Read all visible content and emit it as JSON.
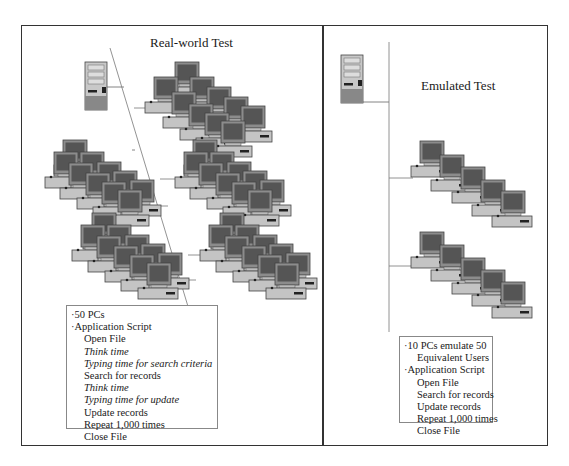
{
  "left_panel": {
    "title": "Real-world Test",
    "pc_count_label": "50 PCs",
    "script": {
      "heading": "Application Script",
      "steps": [
        {
          "label": "Open File",
          "italic": false
        },
        {
          "label": "Think time",
          "italic": true
        },
        {
          "label": "Typing time for search criteria",
          "italic": true
        },
        {
          "label": "Search for records",
          "italic": false
        },
        {
          "label": "Think time",
          "italic": true
        },
        {
          "label": "Typing time for update",
          "italic": true
        },
        {
          "label": "Update records",
          "italic": false
        },
        {
          "label": "Repeat 1,000 times",
          "italic": false
        },
        {
          "label": "Close File",
          "italic": false
        }
      ]
    }
  },
  "right_panel": {
    "title": "Emulated Test",
    "pc_count_label_line1": "10 PCs emulate 50",
    "pc_count_label_line2": "Equivalent Users",
    "script": {
      "heading": "Application Script",
      "steps": [
        {
          "label": "Open File"
        },
        {
          "label": "Search for records"
        },
        {
          "label": "Update records"
        },
        {
          "label": "Repeat 1,000 times"
        },
        {
          "label": "Close File"
        }
      ]
    }
  },
  "bullet": "·",
  "colors": {
    "screen": "#5a5a5a",
    "bezel": "#9a9a9a",
    "base": "#bdbdbd",
    "line": "#666666"
  }
}
